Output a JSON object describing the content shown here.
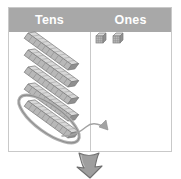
{
  "diagram": {
    "kind": "place-value-chart",
    "topic": "regrouping one ten into ten ones",
    "columns": [
      {
        "id": "tens",
        "label": "Tens"
      },
      {
        "id": "ones",
        "label": "Ones"
      }
    ],
    "tens_column": {
      "rod_count": 5,
      "rod_unit_segments": 10,
      "circled_rod_index": 5,
      "circled_rod_note": "bottom rod is circled for regrouping"
    },
    "ones_column": {
      "cube_count": 2
    },
    "annotations": {
      "curved_arrow": "arrow from circled ten-rod into the ones column",
      "down_arrow": "large down arrow below the chart indicating next step"
    },
    "colors": {
      "header_background": "#a8a8a8",
      "header_text": "#ffffff",
      "table_border": "#c9c9c9",
      "block_fill": "#b5b5b5",
      "block_top": "#d6d6d6",
      "block_side": "#949494",
      "block_outline": "#7d7d7d",
      "circle_stroke": "#a0a0a0",
      "arrow_stroke": "#9a9a9a",
      "down_arrow_fill": "#9e9e9e",
      "down_arrow_stroke": "#6f6f6f",
      "page_background": "#ffffff"
    }
  }
}
